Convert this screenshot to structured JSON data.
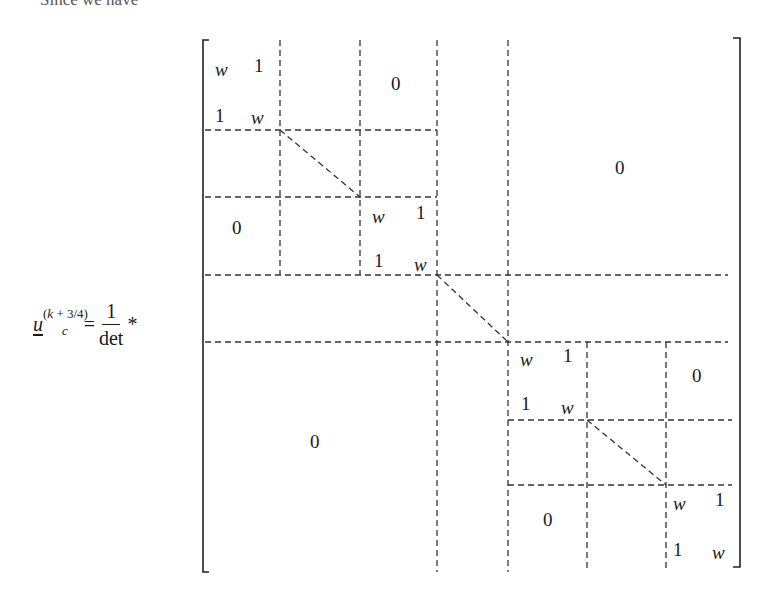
{
  "header_fragment": "Since we have",
  "equation": {
    "lhs_var": "u",
    "lhs_sub": "c",
    "lhs_sup_k": "k",
    "lhs_sup_rest": " + 3/4",
    "equals": "=",
    "frac_num": "1",
    "frac_den": "det",
    "operator": "*"
  },
  "matrix": {
    "blocks": [
      {
        "id": "b1_w",
        "text": "w",
        "italic": true
      },
      {
        "id": "b1_1a",
        "text": "1"
      },
      {
        "id": "b1_1b",
        "text": "1"
      },
      {
        "id": "b1_w2",
        "text": "w",
        "italic": true
      },
      {
        "id": "zero_top_mid",
        "text": "0"
      },
      {
        "id": "zero_top_right",
        "text": "0"
      },
      {
        "id": "zero_left_mid",
        "text": "0"
      },
      {
        "id": "b2_w",
        "text": "w",
        "italic": true
      },
      {
        "id": "b2_1a",
        "text": "1"
      },
      {
        "id": "b2_1b",
        "text": "1"
      },
      {
        "id": "b2_w2",
        "text": "w",
        "italic": true
      },
      {
        "id": "b3_w",
        "text": "w",
        "italic": true
      },
      {
        "id": "b3_1a",
        "text": "1"
      },
      {
        "id": "b3_1b",
        "text": "1"
      },
      {
        "id": "b3_w2",
        "text": "w",
        "italic": true
      },
      {
        "id": "zero_right_mid",
        "text": "0"
      },
      {
        "id": "zero_bottom_left",
        "text": "0"
      },
      {
        "id": "zero_bottom_mid",
        "text": "0"
      },
      {
        "id": "b4_w",
        "text": "w",
        "italic": true
      },
      {
        "id": "b4_1a",
        "text": "1"
      },
      {
        "id": "b4_1b",
        "text": "1"
      },
      {
        "id": "b4_w2",
        "text": "w",
        "italic": true
      }
    ]
  }
}
